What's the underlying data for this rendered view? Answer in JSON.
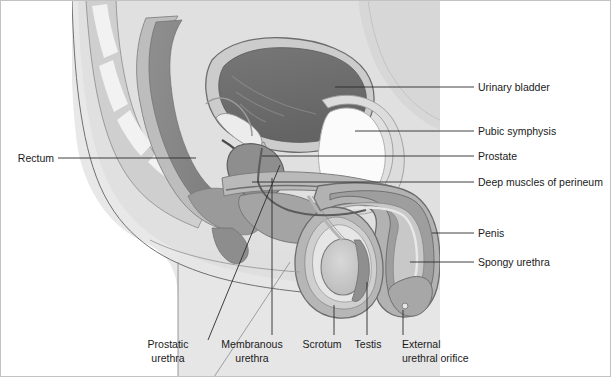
{
  "figure": {
    "background_color": "#ffffff",
    "border_color": "#b4b4b4"
  },
  "palette": {
    "body_light": "#e8e8e8",
    "body_mid": "#d2d2d2",
    "muscle_gray": "#a8a8a8",
    "organ_gray": "#9a9a9a",
    "organ_dark": "#6e6e6e",
    "bladder_interior": "#6a6a6a",
    "bone_white": "#f4f4f4",
    "pubic_symphysis": "#fbfbfb",
    "testis_fill": "#c4c4c4",
    "outline": "#555555",
    "leader_line": "#2b2b2b",
    "text": "#1a1a1a"
  },
  "labels": {
    "right": [
      {
        "id": "urinary-bladder",
        "text": "Urinary bladder",
        "x": 478,
        "y": 87,
        "line_x1": 459,
        "line_x2": 474,
        "target_x": 335,
        "target_y": 87
      },
      {
        "id": "pubic-symphysis",
        "text": "Pubic symphysis",
        "x": 478,
        "y": 131,
        "line_x1": 459,
        "line_x2": 474,
        "target_x": 355,
        "target_y": 131
      },
      {
        "id": "prostate",
        "text": "Prostate",
        "x": 478,
        "y": 156,
        "line_x1": 459,
        "line_x2": 474,
        "target_x": 262,
        "target_y": 156
      },
      {
        "id": "deep-muscles-perineum",
        "text": "Deep muscles of perineum",
        "x": 478,
        "y": 182,
        "line_x1": 459,
        "line_x2": 474,
        "target_x": 252,
        "target_y": 182
      },
      {
        "id": "penis",
        "text": "Penis",
        "x": 478,
        "y": 233,
        "line_x1": 459,
        "line_x2": 474,
        "target_x": 432,
        "target_y": 233
      },
      {
        "id": "spongy-urethra",
        "text": "Spongy urethra",
        "x": 478,
        "y": 262,
        "line_x1": 459,
        "line_x2": 474,
        "target_x": 410,
        "target_y": 262
      }
    ],
    "left": [
      {
        "id": "rectum",
        "text": "Rectum",
        "x": 54,
        "y": 158,
        "line_x1": 58,
        "line_x2": 196,
        "target_y": 158
      }
    ],
    "bottom": [
      {
        "id": "prostatic-urethra",
        "line1": "Prostatic",
        "line2": "urethra",
        "x": 168,
        "y1": 345,
        "y2": 359,
        "lead_kind": "diagonal",
        "lx1": 208,
        "ly1": 340,
        "lx2": 280,
        "ly2": 165
      },
      {
        "id": "membranous-urethra",
        "line1": "Membranous",
        "line2": "urethra",
        "x": 252,
        "y1": 345,
        "y2": 359,
        "lead_kind": "vertical",
        "lx1": 272,
        "ly1": 335,
        "lx2": 272,
        "ly2": 178
      },
      {
        "id": "scrotum",
        "line1": "Scrotum",
        "line2": "",
        "x": 322,
        "y1": 345,
        "y2": 359,
        "lead_kind": "vertical",
        "lx1": 334,
        "ly1": 335,
        "lx2": 334,
        "ly2": 305
      },
      {
        "id": "testis",
        "line1": "Testis",
        "line2": "",
        "x": 368,
        "y1": 345,
        "y2": 359,
        "lead_kind": "vertical",
        "lx1": 367,
        "ly1": 335,
        "lx2": 367,
        "ly2": 282
      },
      {
        "id": "external-urethral-orifice",
        "line1": "External",
        "line2": "urethral orifice",
        "x": 403,
        "y1": 345,
        "y2": 359,
        "lead_kind": "vertical",
        "lx1": 403,
        "ly1": 335,
        "lx2": 403,
        "ly2": 310
      }
    ]
  },
  "anatomy_parts": [
    {
      "id": "body-outline",
      "name": "Body wall / abdominal contour"
    },
    {
      "id": "sacrum",
      "name": "Sacrum and coccyx"
    },
    {
      "id": "rectum-lumen",
      "name": "Rectum"
    },
    {
      "id": "urinary-bladder",
      "name": "Urinary bladder"
    },
    {
      "id": "pubic-symphysis",
      "name": "Pubic symphysis"
    },
    {
      "id": "prostate",
      "name": "Prostate gland"
    },
    {
      "id": "perineum-muscles",
      "name": "Deep muscles of perineum"
    },
    {
      "id": "penis-shaft",
      "name": "Penis"
    },
    {
      "id": "spongy-urethra",
      "name": "Spongy urethra"
    },
    {
      "id": "scrotum",
      "name": "Scrotum"
    },
    {
      "id": "testis",
      "name": "Testis"
    },
    {
      "id": "prostatic-urethra",
      "name": "Prostatic urethra"
    },
    {
      "id": "membranous-urethra",
      "name": "Membranous urethra"
    },
    {
      "id": "external-orifice",
      "name": "External urethral orifice"
    }
  ]
}
